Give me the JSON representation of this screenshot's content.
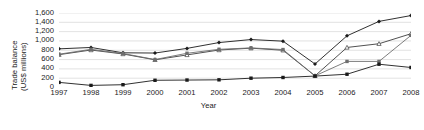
{
  "chart_data": {
    "type": "line",
    "title": "",
    "xlabel": "Year",
    "ylabel": "Trade balance (US$ millions)",
    "ylabel_line1": "Trade balance",
    "ylabel_line2": "(US$ millions)",
    "categories": [
      "1997",
      "1998",
      "1999",
      "2000",
      "2001",
      "2002",
      "2003",
      "2004",
      "2005",
      "2006",
      "2007",
      "2008"
    ],
    "x": [
      1997,
      1998,
      1999,
      2000,
      2001,
      2002,
      2003,
      2004,
      2005,
      2006,
      2007,
      2008
    ],
    "xlim": [
      1997,
      2008
    ],
    "ylim": [
      0,
      1600
    ],
    "yticks": [
      0,
      200,
      400,
      600,
      800,
      1000,
      1200,
      1400,
      1600
    ],
    "ytick_labels": [
      "0",
      "200",
      "400",
      "600",
      "800",
      "1,000",
      "1,200",
      "1,400",
      "1,600"
    ],
    "grid": "horizontal",
    "legend": "none",
    "series": [
      {
        "name": "series-1",
        "marker": "diamond",
        "color": "#1a1a1a",
        "values": [
          830,
          860,
          745,
          740,
          840,
          965,
          1030,
          995,
          505,
          1110,
          1420,
          1545
        ]
      },
      {
        "name": "series-2",
        "marker": "triangle",
        "color": "#3d3d3d",
        "values": [
          705,
          805,
          720,
          595,
          700,
          805,
          845,
          800,
          250,
          860,
          940,
          1155
        ]
      },
      {
        "name": "series-3",
        "marker": "square",
        "color": "#6e6e6e",
        "values": [
          715,
          820,
          730,
          600,
          735,
          820,
          850,
          815,
          250,
          560,
          560,
          1120
        ]
      },
      {
        "name": "series-4",
        "marker": "square",
        "color": "#1a1a1a",
        "values": [
          110,
          45,
          60,
          155,
          160,
          165,
          200,
          215,
          245,
          285,
          500,
          430
        ]
      }
    ]
  }
}
